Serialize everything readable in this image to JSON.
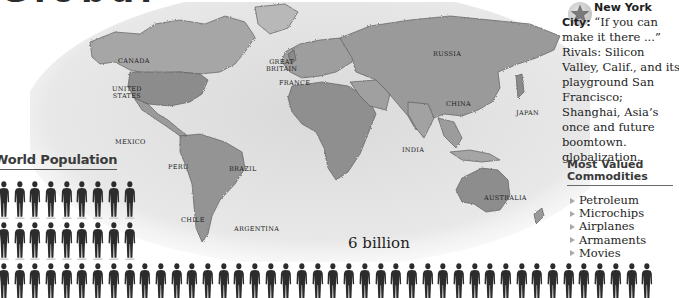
{
  "page": {
    "top_heading_partial": "Globalization"
  },
  "map": {
    "labels": [
      {
        "id": "canada",
        "text": "CANADA",
        "x": 118,
        "y": 58
      },
      {
        "id": "united-states",
        "text": "UNITED\nSTATES",
        "x": 113,
        "y": 86
      },
      {
        "id": "mexico",
        "text": "MEXICO",
        "x": 115,
        "y": 137
      },
      {
        "id": "peru",
        "text": "PERU",
        "x": 166,
        "y": 161
      },
      {
        "id": "brazil",
        "text": "BRAZIL",
        "x": 227,
        "y": 166
      },
      {
        "id": "chile",
        "text": "CHILE",
        "x": 179,
        "y": 216
      },
      {
        "id": "argentina",
        "text": "ARGENTINA",
        "x": 234,
        "y": 224
      },
      {
        "id": "great-britain",
        "text": "GREAT\nBRITAIN",
        "x": 268,
        "y": 60
      },
      {
        "id": "france",
        "text": "FRANCE",
        "x": 279,
        "y": 79
      },
      {
        "id": "russia",
        "text": "RUSSIA",
        "x": 433,
        "y": 49
      },
      {
        "id": "china",
        "text": "CHINA",
        "x": 446,
        "y": 99
      },
      {
        "id": "japan",
        "text": "JAPAN",
        "x": 514,
        "y": 108
      },
      {
        "id": "india",
        "text": "INDIA",
        "x": 400,
        "y": 145
      },
      {
        "id": "australia",
        "text": "AUSTRALIA",
        "x": 484,
        "y": 192
      }
    ]
  },
  "population": {
    "heading": "World Population",
    "label": "6 billion",
    "rows": [
      {
        "count": 9
      },
      {
        "count": 9
      },
      {
        "count": 42
      }
    ]
  },
  "sidebar": {
    "icon": "star-icon",
    "city_title": "New York City:",
    "quote": "“If you can make it there ...”",
    "rivals_text": "Rivals: Silicon Valley, Calif., and its playground",
    "rivals_text_2": "San Francisco; Shanghai, Asia’s once and future boomtown. globalization.",
    "commodities": {
      "heading_line1": "Most Valued",
      "heading_line2": "Commodities",
      "items": [
        "Petroleum",
        "Microchips",
        "Airplanes",
        "Armaments",
        "Movies"
      ]
    }
  },
  "colors": {
    "text": "#1e1e1e",
    "heading": "#3a3a3a",
    "land": "#9a9a9a",
    "sea": "#e4e4e4",
    "figure": "#2c2c2c"
  }
}
